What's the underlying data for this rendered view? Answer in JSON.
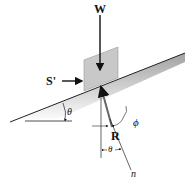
{
  "diagram": {
    "labels": {
      "weight": "W",
      "applied_force": "S'",
      "reaction": "R",
      "incline_angle": "θ",
      "friction_angle": "ϕ",
      "normal_angle": "θ",
      "normal_axis": "n"
    },
    "colors": {
      "block_fill": "#c8c8c8",
      "incline_shade": "#9a9a9a",
      "lines": "#222222"
    }
  }
}
